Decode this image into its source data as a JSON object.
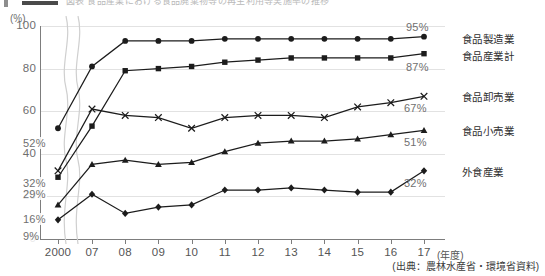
{
  "header": {
    "cut_title": "図表  食品産業における食品廃棄物等の再生利用等実施率の推移",
    "visible": true
  },
  "axes": {
    "y_unit": "(%)",
    "y_ticks": [
      "100",
      "80",
      "60",
      "40",
      "20",
      "0"
    ],
    "y_tick_values": [
      100,
      80,
      60,
      40,
      20,
      0
    ],
    "x_unit": "(年度)",
    "x_ticks": [
      "2000",
      "07",
      "08",
      "09",
      "10",
      "11",
      "12",
      "13",
      "14",
      "15",
      "16",
      "17"
    ],
    "axis_break": "wavy-break-between-2000-and-07"
  },
  "annotations": {
    "start_labels": [
      {
        "text": "52%",
        "series": "食品製造業"
      },
      {
        "text": "32%",
        "series": "食品卸売業"
      },
      {
        "text": "29%",
        "series": "食品産業計"
      },
      {
        "text": "16%",
        "series": "食品小売業"
      },
      {
        "text": "9%",
        "series": "外食産業"
      }
    ],
    "end_labels": [
      {
        "text": "95%",
        "series": "食品製造業"
      },
      {
        "text": "87%",
        "series": "食品産業計"
      },
      {
        "text": "67%",
        "series": "食品卸売業"
      },
      {
        "text": "51%",
        "series": "食品小売業"
      },
      {
        "text": "32%",
        "series": "外食産業"
      }
    ],
    "series_names": [
      "食品製造業",
      "食品産業計",
      "食品卸売業",
      "食品小売業",
      "外食産業"
    ]
  },
  "source": "(出典：農林水産省・環境省資料)",
  "chart_data": {
    "type": "line",
    "title": "食品産業における食品廃棄物等の再生利用等実施率の推移",
    "xlabel": "(年度)",
    "ylabel": "(%)",
    "ylim": [
      0,
      100
    ],
    "ytick_interval": 20,
    "grid": true,
    "legend_position": "right-inline-labels",
    "axis_break_after_first_category": true,
    "categories": [
      "2000",
      "07",
      "08",
      "09",
      "10",
      "11",
      "12",
      "13",
      "14",
      "15",
      "16",
      "17"
    ],
    "series": [
      {
        "name": "食品製造業",
        "marker": "circle",
        "start_value": 52,
        "end_value": 95,
        "values": [
          52,
          81,
          93,
          93,
          93,
          94,
          94,
          94,
          94,
          94,
          94,
          95
        ]
      },
      {
        "name": "食品産業計",
        "marker": "square",
        "start_value": 29,
        "end_value": 87,
        "values": [
          29,
          53,
          79,
          80,
          81,
          83,
          84,
          85,
          85,
          85,
          85,
          87
        ]
      },
      {
        "name": "食品卸売業",
        "marker": "x",
        "start_value": 32,
        "end_value": 67,
        "values": [
          32,
          61,
          58,
          57,
          52,
          57,
          58,
          58,
          57,
          62,
          64,
          67
        ]
      },
      {
        "name": "食品小売業",
        "marker": "triangle",
        "start_value": 16,
        "end_value": 51,
        "values": [
          16,
          35,
          37,
          35,
          36,
          41,
          45,
          46,
          46,
          47,
          49,
          51
        ]
      },
      {
        "name": "外食産業",
        "marker": "diamond",
        "start_value": 9,
        "end_value": 32,
        "values": [
          9,
          21,
          12,
          15,
          16,
          23,
          23,
          24,
          23,
          22,
          22,
          32
        ]
      }
    ]
  }
}
